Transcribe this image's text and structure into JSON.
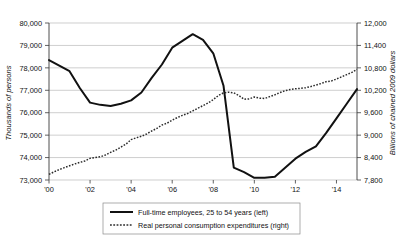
{
  "chart_data": {
    "type": "line",
    "title": "",
    "subtitle": "",
    "xlabel": "",
    "ylabel": "Thousands of persons",
    "y2label": "Billions of chained 2009 dollars",
    "grid": true,
    "legend_position": "bottom",
    "xlim": [
      2000,
      2015
    ],
    "x_tick_labels": [
      "'00",
      "'02",
      "'04",
      "'06",
      "'08",
      "'10",
      "'12",
      "'14"
    ],
    "x_tick_values": [
      2000,
      2002,
      2004,
      2006,
      2008,
      2010,
      2012,
      2014
    ],
    "ylim": [
      73000,
      80000
    ],
    "y_tick_labels": [
      "73,000",
      "74,000",
      "75,000",
      "76,000",
      "77,000",
      "78,000",
      "79,000",
      "80,000"
    ],
    "y_tick_values": [
      73000,
      74000,
      75000,
      76000,
      77000,
      78000,
      79000,
      80000
    ],
    "y2lim": [
      7800,
      12000
    ],
    "y2_tick_labels": [
      "7,800",
      "8,400",
      "9,000",
      "9,600",
      "10,200",
      "10,800",
      "11,400",
      "12,000"
    ],
    "y2_tick_values": [
      7800,
      8400,
      9000,
      9600,
      10200,
      10800,
      11400,
      12000
    ],
    "series": [
      {
        "name": "Full-time employees, 25 to 54 years (left)",
        "axis": "left",
        "style": "solid",
        "color": "#111111",
        "x": [
          2000.0,
          2000.5,
          2001.0,
          2001.5,
          2002.0,
          2002.5,
          2003.0,
          2003.5,
          2004.0,
          2004.5,
          2005.0,
          2005.5,
          2006.0,
          2006.5,
          2007.0,
          2007.5,
          2008.0,
          2008.5,
          2009.0,
          2009.5,
          2010.0,
          2010.5,
          2011.0,
          2011.5,
          2012.0,
          2012.5,
          2013.0,
          2013.5,
          2014.0,
          2014.5,
          2015.0
        ],
        "values": [
          78350,
          78100,
          77850,
          77100,
          76450,
          76350,
          76300,
          76400,
          76550,
          76900,
          77550,
          78150,
          78900,
          79200,
          79500,
          79250,
          78650,
          77200,
          73550,
          73350,
          73100,
          73100,
          73150,
          73550,
          73950,
          74250,
          74500,
          75100,
          75750,
          76400,
          77050
        ]
      },
      {
        "name": "Real personal consumption expenditures (right)",
        "axis": "right",
        "style": "dotted",
        "color": "#2b2b2b",
        "x": [
          2000.0,
          2000.25,
          2000.5,
          2000.75,
          2001.0,
          2001.25,
          2001.5,
          2001.75,
          2002.0,
          2002.25,
          2002.5,
          2002.75,
          2003.0,
          2003.25,
          2003.5,
          2003.75,
          2004.0,
          2004.25,
          2004.5,
          2004.75,
          2005.0,
          2005.25,
          2005.5,
          2005.75,
          2006.0,
          2006.25,
          2006.5,
          2006.75,
          2007.0,
          2007.25,
          2007.5,
          2007.75,
          2008.0,
          2008.25,
          2008.5,
          2008.75,
          2009.0,
          2009.25,
          2009.5,
          2009.75,
          2010.0,
          2010.25,
          2010.5,
          2010.75,
          2011.0,
          2011.25,
          2011.5,
          2011.75,
          2012.0,
          2012.25,
          2012.5,
          2012.75,
          2013.0,
          2013.25,
          2013.5,
          2013.75,
          2014.0,
          2014.25,
          2014.5,
          2014.75,
          2015.0
        ],
        "values": [
          7950,
          8020,
          8080,
          8130,
          8180,
          8230,
          8270,
          8310,
          8380,
          8400,
          8420,
          8470,
          8540,
          8600,
          8680,
          8760,
          8880,
          8930,
          8970,
          9030,
          9110,
          9180,
          9270,
          9320,
          9400,
          9470,
          9530,
          9580,
          9650,
          9720,
          9790,
          9860,
          9950,
          10060,
          10130,
          10150,
          10130,
          10060,
          9960,
          9970,
          10020,
          9990,
          9980,
          10030,
          10080,
          10140,
          10190,
          10220,
          10240,
          10250,
          10270,
          10300,
          10340,
          10380,
          10430,
          10450,
          10500,
          10560,
          10620,
          10680,
          10760
        ]
      }
    ]
  },
  "legend": {
    "items": [
      {
        "label": "Full-time employees, 25 to 54 years (left)",
        "style": "solid"
      },
      {
        "label": "Real personal consumption expenditures (right)",
        "style": "dotted"
      }
    ]
  }
}
